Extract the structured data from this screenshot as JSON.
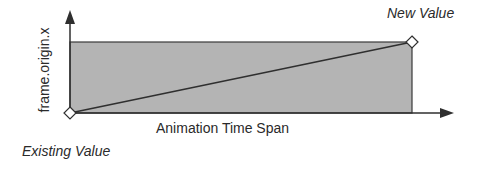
{
  "diagram": {
    "y_axis_label": "frame.origin.x",
    "x_axis_label": "Animation Time Span",
    "start_label": "Existing Value",
    "end_label": "New Value",
    "colors": {
      "fill": "#b4b4b4",
      "stroke": "#2f2f2f",
      "text": "#2a2a2a",
      "marker_fill": "#ffffff"
    }
  }
}
